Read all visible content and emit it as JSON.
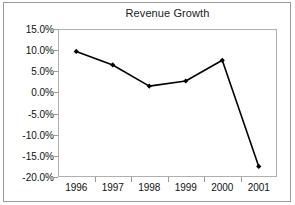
{
  "chart_data": {
    "type": "line",
    "title": "Revenue Growth",
    "xlabel": "",
    "ylabel": "",
    "categories": [
      "1996",
      "1997",
      "1998",
      "1999",
      "2000",
      "2001"
    ],
    "values": [
      9.7,
      6.5,
      1.5,
      2.7,
      7.6,
      -17.5
    ],
    "series": [
      {
        "name": "Revenue Growth",
        "values": [
          9.7,
          6.5,
          1.5,
          2.7,
          7.6,
          -17.5
        ]
      }
    ],
    "ylim": [
      -20.0,
      15.0
    ],
    "ytick_values": [
      15.0,
      10.0,
      5.0,
      0.0,
      -5.0,
      -10.0,
      -15.0,
      -20.0
    ],
    "ytick_labels": [
      "15.0%",
      "10.0%",
      "5.0%",
      "0.0%",
      "-5.0%",
      "-10.0%",
      "-15.0%",
      "-20.0%"
    ],
    "xtick_labels": [
      "1996",
      "1997",
      "1998",
      "1999",
      "2000",
      "2001"
    ],
    "grid": false,
    "legend": false,
    "legend_position": "none",
    "marker": "diamond",
    "marker_color": "#000000",
    "line_color": "#000000",
    "plot_background": "#ffffff",
    "axis_color": "#b0b0b0",
    "frame_color": "#9a9a9a",
    "text_color": "#111111"
  }
}
